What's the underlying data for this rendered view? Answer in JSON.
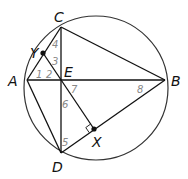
{
  "diagram": {
    "type": "geometry",
    "circle": {
      "cx": 96,
      "cy": 88,
      "r": 72
    },
    "points": [
      {
        "id": "C",
        "label": "C",
        "x": 61,
        "y": 27,
        "lx": 54,
        "ly": 22
      },
      {
        "id": "A",
        "label": "A",
        "x": 27,
        "y": 80,
        "lx": 8,
        "ly": 86
      },
      {
        "id": "E",
        "label": "E",
        "x": 61,
        "y": 80,
        "lx": 64,
        "ly": 77
      },
      {
        "id": "B",
        "label": "B",
        "x": 165,
        "y": 80,
        "lx": 171,
        "ly": 86
      },
      {
        "id": "D",
        "label": "D",
        "x": 61,
        "y": 153,
        "lx": 52,
        "ly": 172
      },
      {
        "id": "Y",
        "label": "Y",
        "x": 43,
        "y": 53,
        "lx": 30,
        "ly": 58
      },
      {
        "id": "X",
        "label": "X",
        "x": 94,
        "y": 129,
        "lx": 92,
        "ly": 147
      }
    ],
    "segments": [
      [
        "A",
        "C"
      ],
      [
        "C",
        "B"
      ],
      [
        "B",
        "D"
      ],
      [
        "D",
        "A"
      ],
      [
        "A",
        "B"
      ],
      [
        "C",
        "D"
      ],
      [
        "Y",
        "X"
      ]
    ],
    "angle_labels": [
      {
        "label": "1",
        "x": 36,
        "y": 78
      },
      {
        "label": "2",
        "x": 46,
        "y": 78
      },
      {
        "label": "3",
        "x": 52,
        "y": 65
      },
      {
        "label": "4",
        "x": 52,
        "y": 48
      },
      {
        "label": "5",
        "x": 62,
        "y": 146
      },
      {
        "label": "6",
        "x": 62,
        "y": 108
      },
      {
        "label": "7",
        "x": 71,
        "y": 93
      },
      {
        "label": "8",
        "x": 137,
        "y": 93
      }
    ],
    "right_angle_at": "X"
  }
}
